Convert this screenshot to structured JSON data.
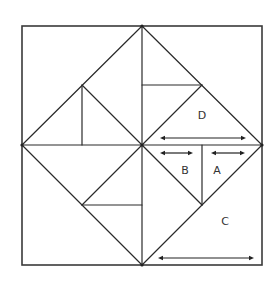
{
  "diagram": {
    "width": 279,
    "height": 285,
    "colors": {
      "background": "#ffffff",
      "line": "#2a2a2a",
      "frame": "#3a3a3a",
      "arrow": "#222222",
      "label": "#333333"
    },
    "frame": {
      "x": 22,
      "y": 26,
      "width": 240,
      "height": 239
    },
    "vertices": [
      {
        "name": "top",
        "x": 142,
        "y": 26
      },
      {
        "name": "left",
        "x": 22,
        "y": 145
      },
      {
        "name": "right",
        "x": 262,
        "y": 145
      },
      {
        "name": "bottom",
        "x": 142,
        "y": 265
      },
      {
        "name": "center",
        "x": 142,
        "y": 145
      }
    ],
    "segments": [
      {
        "name": "diamond-top-left-edge",
        "x1": 142,
        "y1": 26,
        "x2": 22,
        "y2": 145
      },
      {
        "name": "diamond-top-right-edge",
        "x1": 142,
        "y1": 26,
        "x2": 262,
        "y2": 145
      },
      {
        "name": "diamond-bottom-left-edge",
        "x1": 22,
        "y1": 145,
        "x2": 142,
        "y2": 265
      },
      {
        "name": "diamond-bottom-right-edge",
        "x1": 262,
        "y1": 145,
        "x2": 142,
        "y2": 265
      },
      {
        "name": "horizontal-midline",
        "x1": 22,
        "y1": 145,
        "x2": 262,
        "y2": 145
      },
      {
        "name": "vertical-midline",
        "x1": 142,
        "y1": 26,
        "x2": 142,
        "y2": 265
      },
      {
        "name": "upper-left-diagonal",
        "x1": 82,
        "y1": 85,
        "x2": 142,
        "y2": 145
      },
      {
        "name": "upper-left-vertical",
        "x1": 82,
        "y1": 85,
        "x2": 82,
        "y2": 145
      },
      {
        "name": "upper-right-horizontal",
        "x1": 142,
        "y1": 85,
        "x2": 202,
        "y2": 85
      },
      {
        "name": "upper-right-diagonal",
        "x1": 202,
        "y1": 85,
        "x2": 142,
        "y2": 145
      },
      {
        "name": "lower-left-diagonal",
        "x1": 82,
        "y1": 205,
        "x2": 142,
        "y2": 145
      },
      {
        "name": "lower-left-horizontal",
        "x1": 82,
        "y1": 205,
        "x2": 142,
        "y2": 205
      },
      {
        "name": "lower-right-diagonal",
        "x1": 142,
        "y1": 145,
        "x2": 202,
        "y2": 205
      },
      {
        "name": "lower-right-vertical",
        "x1": 202,
        "y1": 145,
        "x2": 202,
        "y2": 205
      }
    ],
    "pieces": [
      {
        "label": "D",
        "x": 202,
        "y": 116
      },
      {
        "label": "B",
        "x": 185,
        "y": 171
      },
      {
        "label": "A",
        "x": 217,
        "y": 171
      },
      {
        "label": "C",
        "x": 225,
        "y": 222
      }
    ],
    "arrows": [
      {
        "name": "d-width-arrow",
        "piece": "D",
        "x1": 160,
        "x2": 246,
        "y": 138
      },
      {
        "name": "b-width-arrow",
        "piece": "B",
        "x1": 160,
        "x2": 193,
        "y": 153
      },
      {
        "name": "a-width-arrow",
        "piece": "A",
        "x1": 211,
        "x2": 245,
        "y": 153
      },
      {
        "name": "c-width-arrow",
        "piece": "C",
        "x1": 158,
        "x2": 254,
        "y": 258
      }
    ]
  }
}
